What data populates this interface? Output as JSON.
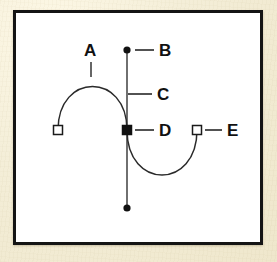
{
  "figure": {
    "background_color": "#f1ead4",
    "panel_color": "#ffffff",
    "border_color": "#141414",
    "ink_color": "#1a1a1a"
  },
  "labels": [
    {
      "id": "A",
      "text": "A",
      "meaning": "curve-segment",
      "x": 84,
      "y": 42
    },
    {
      "id": "B",
      "text": "B",
      "meaning": "direction-point",
      "x": 159,
      "y": 42
    },
    {
      "id": "C",
      "text": "C",
      "meaning": "direction-line",
      "x": 157,
      "y": 86
    },
    {
      "id": "D",
      "text": "D",
      "meaning": "selected-anchor-point",
      "x": 159,
      "y": 122
    },
    {
      "id": "E",
      "text": "E",
      "meaning": "endpoint-anchor",
      "x": 227,
      "y": 122
    }
  ],
  "geometry": {
    "anchor_left": {
      "x": 58,
      "y": 130,
      "style": "hollow-square"
    },
    "anchor_center": {
      "x": 127,
      "y": 130,
      "style": "filled-square"
    },
    "anchor_right": {
      "x": 197,
      "y": 130,
      "style": "hollow-square"
    },
    "handle_top": {
      "x": 127,
      "y": 50,
      "style": "filled-dot"
    },
    "handle_bottom": {
      "x": 127,
      "y": 208,
      "style": "filled-dot"
    },
    "direction_line": {
      "x1": 127,
      "y1": 50,
      "x2": 127,
      "y2": 208
    },
    "curve_left": "M 58 130 C 58 72, 127 72, 127 130",
    "curve_right": "M 127 130 C 127 190, 197 190, 197 130",
    "leaders": [
      {
        "name": "leader-A",
        "x1": 91,
        "y1": 62,
        "x2": 91,
        "y2": 76
      },
      {
        "name": "leader-B",
        "x1": 135,
        "y1": 50,
        "x2": 154,
        "y2": 50
      },
      {
        "name": "leader-C",
        "x1": 127,
        "y1": 94,
        "x2": 152,
        "y2": 94
      },
      {
        "name": "leader-D",
        "x1": 135,
        "y1": 130,
        "x2": 154,
        "y2": 130
      },
      {
        "name": "leader-E",
        "x1": 205,
        "y1": 130,
        "x2": 222,
        "y2": 130
      }
    ]
  }
}
